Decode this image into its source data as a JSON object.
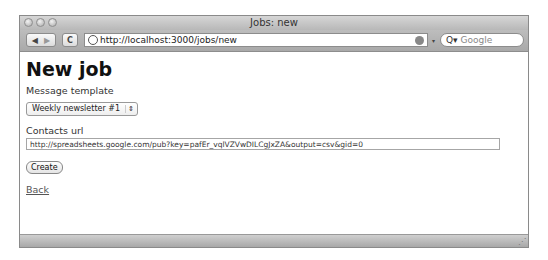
{
  "window": {
    "title": "Jobs: new"
  },
  "toolbar": {
    "back_icon": "◀",
    "forward_icon": "▶",
    "reload_icon": "C",
    "url": "http://localhost:3000/jobs/new",
    "snapback_icon": "▾",
    "search_placeholder": "Google",
    "search_icon": "Q▾"
  },
  "page": {
    "heading": "New job",
    "template_label": "Message template",
    "template_value": "Weekly newsletter #1",
    "select_arrows": "⇕",
    "contacts_label": "Contacts url",
    "contacts_value": "http://spreadsheets.google.com/pub?key=pafEr_vqlVZVwDILCgJxZA&output=csv&gid=0",
    "create_button": "Create",
    "back_link": "Back"
  },
  "statusbar": {
    "grip": "⋰"
  }
}
